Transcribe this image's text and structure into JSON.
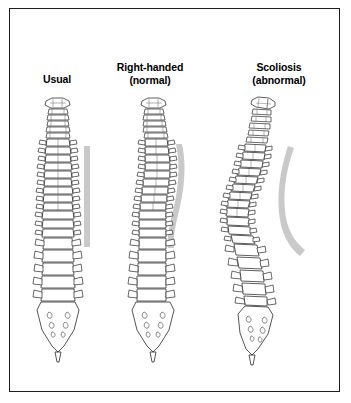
{
  "figure": {
    "border_color": "#1c1c1c",
    "background_color": "#ffffff",
    "ink_color": "#2a2a2a",
    "reference_bar_color": "#c9c9c9"
  },
  "panels": [
    {
      "id": "usual",
      "label_line1": "Usual",
      "label_line2": "",
      "curvature": "straight",
      "reference_bar": "straight-vertical"
    },
    {
      "id": "right-handed",
      "label_line1": "Right-handed",
      "label_line2": "(normal)",
      "curvature": "slight-curve",
      "reference_bar": "gentle-s-curve"
    },
    {
      "id": "scoliosis",
      "label_line1": "Scoliosis",
      "label_line2": "(abnormal)",
      "curvature": "pronounced-s-curve",
      "reference_bar": "strong-c-curve"
    }
  ]
}
